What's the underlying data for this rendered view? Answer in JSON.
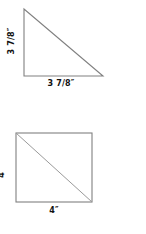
{
  "page": {
    "background_color": "#ffffff",
    "stroke_color": "#808080",
    "text_color": "#111111"
  },
  "figures": [
    {
      "id": "triangle",
      "shape": "right-triangle",
      "vertices_px": [
        [
          24,
          9
        ],
        [
          24,
          76
        ],
        [
          103,
          76
        ]
      ],
      "height_label": "3 7/8″",
      "base_label": "3 7/8″"
    },
    {
      "id": "square",
      "shape": "square-with-diagonal",
      "bounds_px": [
        16,
        16,
        76,
        69
      ],
      "diagonal": "top-left-to-bottom-right",
      "height_label": "4″",
      "base_label": "4″"
    }
  ]
}
